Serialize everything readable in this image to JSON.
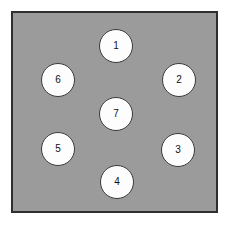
{
  "figure": {
    "kind": "node-layout-diagram",
    "panel": {
      "background_color": "#9b9b9b",
      "border_color": "#2e2e2e",
      "page_background_color": "#ffffff"
    },
    "node_style": {
      "fill_color": "#fdfdfd",
      "stroke_color": "#3a3a3a",
      "text_color": "#111111"
    },
    "nodes": [
      {
        "label": "1",
        "cx": 116,
        "cy": 46,
        "r": 17
      },
      {
        "label": "2",
        "cx": 179,
        "cy": 80,
        "r": 17
      },
      {
        "label": "3",
        "cx": 178,
        "cy": 150,
        "r": 17
      },
      {
        "label": "4",
        "cx": 117,
        "cy": 182,
        "r": 17
      },
      {
        "label": "5",
        "cx": 58,
        "cy": 149,
        "r": 17
      },
      {
        "label": "6",
        "cx": 58,
        "cy": 80,
        "r": 17
      },
      {
        "label": "7",
        "cx": 116,
        "cy": 114,
        "r": 17
      }
    ]
  }
}
